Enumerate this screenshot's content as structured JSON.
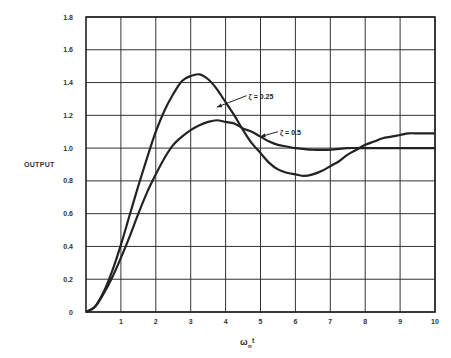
{
  "chart_data": {
    "type": "line",
    "title": "",
    "xlabel": "ωnt",
    "xlabel_main": "ω",
    "xlabel_sub": "n",
    "xlabel_tail": "t",
    "ylabel": "OUTPUT",
    "xlim": [
      0,
      10
    ],
    "ylim": [
      0,
      1.8
    ],
    "grid": true,
    "x_ticks": [
      1,
      2,
      3,
      4,
      5,
      6,
      7,
      8,
      9,
      10
    ],
    "y_ticks": [
      0,
      0.2,
      0.4,
      0.6,
      0.8,
      1.0,
      1.2,
      1.4,
      1.6,
      1.8
    ],
    "x_tick_labels": [
      "1",
      "2",
      "3",
      "4",
      "5",
      "6",
      "7",
      "8",
      "9",
      "10"
    ],
    "y_tick_labels": [
      "0",
      "0.2",
      "0.4",
      "0.6",
      "0.8",
      "1.0",
      "1.2",
      "1.4",
      "1.6",
      "1.8"
    ],
    "series": [
      {
        "name": "ζ = 0.25",
        "annotation": "ζ = 0.25",
        "x": [
          0,
          0.25,
          0.5,
          0.75,
          1.0,
          1.25,
          1.5,
          1.75,
          2.0,
          2.25,
          2.5,
          2.75,
          3.0,
          3.25,
          3.5,
          3.75,
          4.0,
          4.25,
          4.5,
          4.75,
          5.0,
          5.25,
          5.5,
          5.75,
          6.0,
          6.25,
          6.5,
          6.75,
          7.0,
          7.25,
          7.5,
          7.75,
          8.0,
          8.25,
          8.5,
          8.75,
          9.0,
          9.25,
          9.5,
          9.75,
          10.0
        ],
        "values": [
          0,
          0.03,
          0.12,
          0.25,
          0.41,
          0.59,
          0.77,
          0.94,
          1.1,
          1.23,
          1.33,
          1.41,
          1.44,
          1.45,
          1.42,
          1.36,
          1.28,
          1.2,
          1.11,
          1.03,
          0.97,
          0.91,
          0.87,
          0.85,
          0.84,
          0.83,
          0.84,
          0.86,
          0.89,
          0.92,
          0.96,
          0.99,
          1.02,
          1.04,
          1.06,
          1.07,
          1.08,
          1.09,
          1.09,
          1.09,
          1.09
        ]
      },
      {
        "name": "ζ = 0.5",
        "annotation": "ζ = 0.5",
        "x": [
          0,
          0.25,
          0.5,
          0.75,
          1.0,
          1.25,
          1.5,
          1.75,
          2.0,
          2.25,
          2.5,
          2.75,
          3.0,
          3.25,
          3.5,
          3.75,
          4.0,
          4.25,
          4.5,
          4.75,
          5.0,
          5.25,
          5.5,
          5.75,
          6.0,
          6.5,
          7.0,
          7.5,
          8.0,
          8.5,
          9.0,
          9.5,
          10.0
        ],
        "values": [
          0,
          0.03,
          0.11,
          0.21,
          0.33,
          0.46,
          0.6,
          0.73,
          0.84,
          0.94,
          1.02,
          1.07,
          1.11,
          1.14,
          1.16,
          1.17,
          1.16,
          1.15,
          1.12,
          1.1,
          1.07,
          1.04,
          1.02,
          1.01,
          1.0,
          0.99,
          0.99,
          1.0,
          1.0,
          1.0,
          1.0,
          1.0,
          1.0
        ]
      }
    ],
    "annotations": [
      {
        "text": "ζ = 0.25",
        "arrow_from": [
          4.6,
          1.32
        ],
        "arrow_to": [
          3.75,
          1.25
        ]
      },
      {
        "text": "ζ = 0.5",
        "arrow_from": [
          5.5,
          1.1
        ],
        "arrow_to": [
          5.0,
          1.07
        ]
      }
    ]
  },
  "colors": {
    "line": "#222222",
    "grid": "#333333",
    "text": "#333333",
    "background": "#ffffff"
  }
}
